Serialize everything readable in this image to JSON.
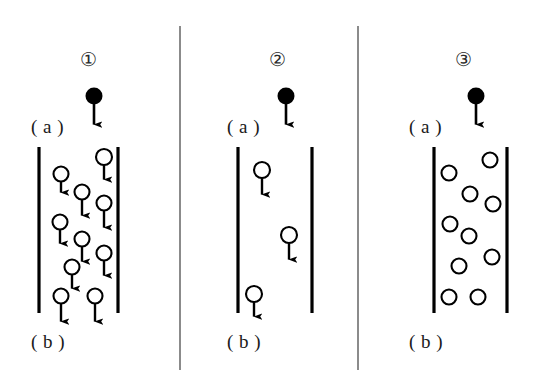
{
  "figure": {
    "width": 535,
    "height": 390,
    "background": "#ffffff",
    "ink": "#000000",
    "divider_color": "#5a5a5a",
    "label_color": "#1a1a1a"
  },
  "dividers": [
    {
      "name": "divider-1-2",
      "x": 180,
      "y1": 26,
      "y2": 370
    },
    {
      "name": "divider-2-3",
      "x": 358,
      "y1": 26,
      "y2": 370
    }
  ],
  "panels": [
    {
      "id": "panel-1",
      "number_label": "①",
      "number_x": 88,
      "number_y": 50,
      "stage_a_label": "( a )",
      "stage_a_x": 31,
      "stage_a_y": 117,
      "stage_b_label": "( b )",
      "stage_b_x": 31,
      "stage_b_y": 332,
      "incoming_particle": {
        "cx": 94,
        "cy": 96,
        "r": 8.5,
        "fill": "#000000"
      },
      "incoming_arrow": {
        "x": 94,
        "y1": 104,
        "y2": 133
      },
      "wall_left_x": 39,
      "wall_right_x": 118,
      "wall_top_y": 147,
      "wall_bottom_y": 313,
      "wall_width": 3.2,
      "particles": [
        {
          "cx": 61,
          "cy": 174,
          "r": 7.5,
          "arrow_to": 201
        },
        {
          "cx": 104,
          "cy": 157,
          "r": 8.0,
          "arrow_to": 188
        },
        {
          "cx": 82,
          "cy": 192,
          "r": 7.5,
          "arrow_to": 224
        },
        {
          "cx": 104,
          "cy": 203,
          "r": 7.5,
          "arrow_to": 236
        },
        {
          "cx": 60,
          "cy": 222,
          "r": 7.5,
          "arrow_to": 252
        },
        {
          "cx": 82,
          "cy": 239,
          "r": 7.5,
          "arrow_to": 270
        },
        {
          "cx": 104,
          "cy": 253,
          "r": 7.5,
          "arrow_to": 284
        },
        {
          "cx": 72,
          "cy": 267,
          "r": 7.5,
          "arrow_to": 297
        },
        {
          "cx": 61,
          "cy": 296,
          "r": 7.5,
          "arrow_to": 330
        },
        {
          "cx": 95,
          "cy": 296,
          "r": 7.5,
          "arrow_to": 330
        }
      ]
    },
    {
      "id": "panel-2",
      "number_label": "②",
      "number_x": 277,
      "number_y": 50,
      "stage_a_label": "( a )",
      "stage_a_x": 227,
      "stage_a_y": 117,
      "stage_b_label": "( b )",
      "stage_b_x": 227,
      "stage_b_y": 332,
      "incoming_particle": {
        "cx": 286,
        "cy": 96,
        "r": 8.5,
        "fill": "#000000"
      },
      "incoming_arrow": {
        "x": 286,
        "y1": 104,
        "y2": 133
      },
      "wall_left_x": 238,
      "wall_right_x": 312,
      "wall_top_y": 147,
      "wall_bottom_y": 313,
      "wall_width": 3.2,
      "particles": [
        {
          "cx": 262,
          "cy": 170,
          "r": 8.0,
          "arrow_to": 203
        },
        {
          "cx": 289,
          "cy": 235,
          "r": 8.0,
          "arrow_to": 268
        },
        {
          "cx": 254,
          "cy": 294,
          "r": 8.0,
          "arrow_to": 325
        }
      ]
    },
    {
      "id": "panel-3",
      "number_label": "③",
      "number_x": 463,
      "number_y": 50,
      "stage_a_label": "( a )",
      "stage_a_x": 409,
      "stage_a_y": 117,
      "stage_b_label": "( b )",
      "stage_b_x": 409,
      "stage_b_y": 332,
      "incoming_particle": {
        "cx": 476,
        "cy": 96,
        "r": 8.5,
        "fill": "#000000"
      },
      "incoming_arrow": {
        "x": 476,
        "y1": 104,
        "y2": 133
      },
      "wall_left_x": 434,
      "wall_right_x": 507,
      "wall_top_y": 147,
      "wall_bottom_y": 313,
      "wall_width": 3.2,
      "particles": [
        {
          "cx": 449,
          "cy": 173,
          "r": 7.5,
          "arrow_to": null
        },
        {
          "cx": 490,
          "cy": 160,
          "r": 7.5,
          "arrow_to": null
        },
        {
          "cx": 470,
          "cy": 194,
          "r": 7.5,
          "arrow_to": null
        },
        {
          "cx": 493,
          "cy": 204,
          "r": 7.5,
          "arrow_to": null
        },
        {
          "cx": 450,
          "cy": 224,
          "r": 7.5,
          "arrow_to": null
        },
        {
          "cx": 469,
          "cy": 236,
          "r": 7.5,
          "arrow_to": null
        },
        {
          "cx": 492,
          "cy": 257,
          "r": 7.5,
          "arrow_to": null
        },
        {
          "cx": 459,
          "cy": 266,
          "r": 7.5,
          "arrow_to": null
        },
        {
          "cx": 449,
          "cy": 297,
          "r": 7.5,
          "arrow_to": null
        },
        {
          "cx": 478,
          "cy": 297,
          "r": 7.5,
          "arrow_to": null
        }
      ]
    }
  ],
  "chart_data": {
    "type": "diagram",
    "title": "",
    "panel_labels": [
      "①",
      "②",
      "③"
    ],
    "stage_labels": [
      "( a )",
      "( b )"
    ],
    "particle_counts": [
      10,
      3,
      10
    ],
    "arrows_present": [
      true,
      true,
      false
    ]
  }
}
